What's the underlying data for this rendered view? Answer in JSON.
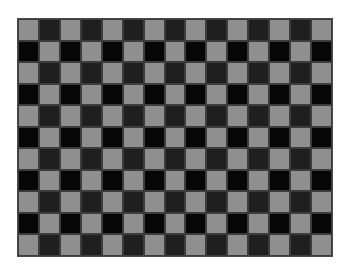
{
  "board": {
    "columns": 15,
    "rows": 11,
    "top_left_color": "light",
    "colors": {
      "light": "#8f8f8f",
      "dark_even_row": "#1f1f1f",
      "dark_odd_row": "#060606",
      "grid_line": "#3c3c3c",
      "border": "#4a4a4a",
      "background": "#ffffff"
    }
  }
}
